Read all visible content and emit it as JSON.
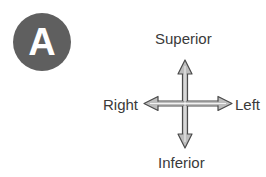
{
  "badge": {
    "label": "A",
    "color": "#5f5f5f"
  },
  "directions": {
    "top": "Superior",
    "bottom": "Inferior",
    "left": "Right",
    "right": "Left"
  },
  "arrow": {
    "fill": "#b8b8b8",
    "stroke": "#4a4a4a",
    "icon": "four-way-arrow"
  }
}
